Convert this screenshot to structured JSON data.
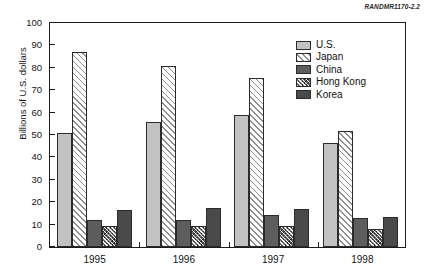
{
  "source_tag": "RANDMR1170-2.2",
  "chart_data": {
    "type": "bar",
    "title": "",
    "subtitle": "",
    "xlabel": "",
    "ylabel": "Billions of U.S. dollars",
    "categories": [
      "1995",
      "1996",
      "1997",
      "1998"
    ],
    "ylim": [
      0,
      100
    ],
    "ytick_labels": [
      "0",
      "10",
      "20",
      "30",
      "40",
      "50",
      "60",
      "70",
      "80",
      "90",
      "100"
    ],
    "ytick_values": [
      0,
      10,
      20,
      30,
      40,
      50,
      60,
      70,
      80,
      90,
      100
    ],
    "grid": false,
    "legend_position": "top-right inside plot",
    "series": [
      {
        "name": "U.S.",
        "values": [
          51.0,
          56.0,
          59.0,
          46.5
        ],
        "pattern": "solid-light-gray",
        "color": "#c2c2c2"
      },
      {
        "name": "Japan",
        "values": [
          87.0,
          81.0,
          75.5,
          52.0
        ],
        "pattern": "diagonal-hatch",
        "color": "#ffffff"
      },
      {
        "name": "China",
        "values": [
          12.0,
          12.0,
          14.5,
          13.0
        ],
        "pattern": "solid-dark-gray",
        "color": "#5d5d5d"
      },
      {
        "name": "Hong Kong",
        "values": [
          9.5,
          9.5,
          9.5,
          8.0
        ],
        "pattern": "dense-crosshatch",
        "color": "#6a6a6a"
      },
      {
        "name": "Korea",
        "values": [
          16.5,
          17.5,
          17.0,
          13.5
        ],
        "pattern": "solid-darkest-gray",
        "color": "#4a4a4a"
      }
    ]
  }
}
